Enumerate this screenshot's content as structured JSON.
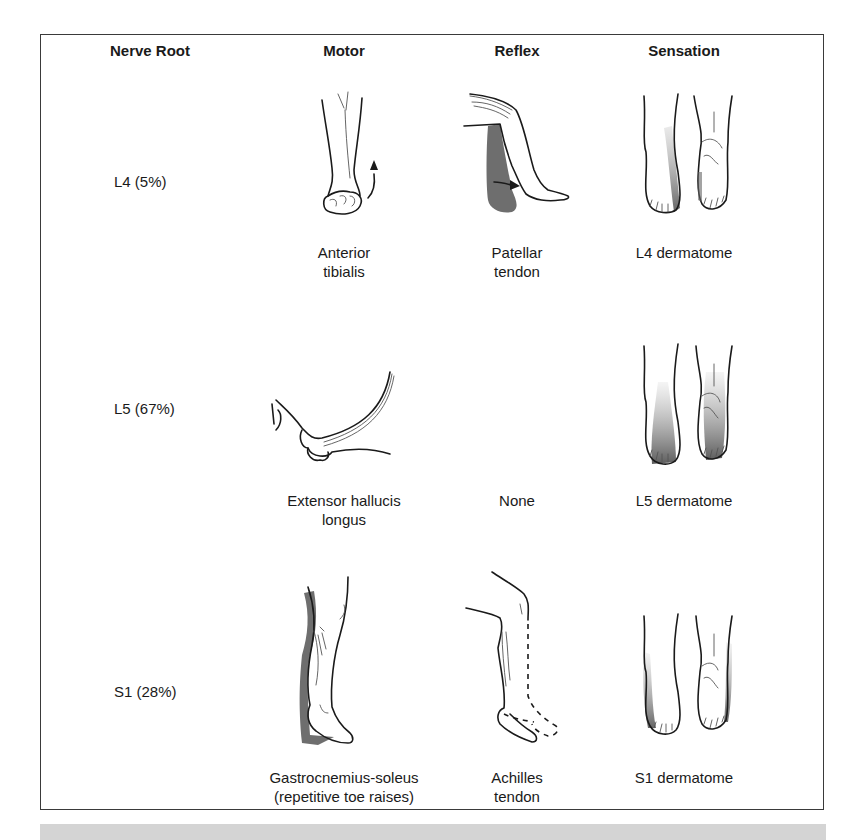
{
  "table": {
    "headers": {
      "nerve_root": "Nerve Root",
      "motor": "Motor",
      "reflex": "Reflex",
      "sensation": "Sensation"
    },
    "rows": [
      {
        "nerve_root": "L4 (5%)",
        "motor": {
          "line1": "Anterior",
          "line2": "tibialis",
          "icon": "ankle-dorsiflexion-illustration"
        },
        "reflex": {
          "line1": "Patellar",
          "line2": "tendon",
          "icon": "knee-jerk-illustration"
        },
        "sensation": {
          "line1": "L4 dermatome",
          "line2": "",
          "icon": "feet-dermatome-l4-illustration"
        }
      },
      {
        "nerve_root": "L5 (67%)",
        "motor": {
          "line1": "Extensor hallucis",
          "line2": "longus",
          "icon": "great-toe-extension-illustration"
        },
        "reflex": {
          "line1": "None",
          "line2": "",
          "icon": ""
        },
        "sensation": {
          "line1": "L5 dermatome",
          "line2": "",
          "icon": "feet-dermatome-l5-illustration"
        }
      },
      {
        "nerve_root": "S1 (28%)",
        "motor": {
          "line1": "Gastrocnemius-soleus",
          "line2": "(repetitive toe raises)",
          "icon": "toe-raise-illustration"
        },
        "reflex": {
          "line1": "Achilles",
          "line2": "tendon",
          "icon": "ankle-jerk-illustration"
        },
        "sensation": {
          "line1": "S1 dermatome",
          "line2": "",
          "icon": "feet-dermatome-s1-illustration"
        }
      }
    ]
  },
  "colors": {
    "border": "#3a3a3a",
    "shading": "#6e6e6e",
    "band": "#d4d4d4"
  }
}
